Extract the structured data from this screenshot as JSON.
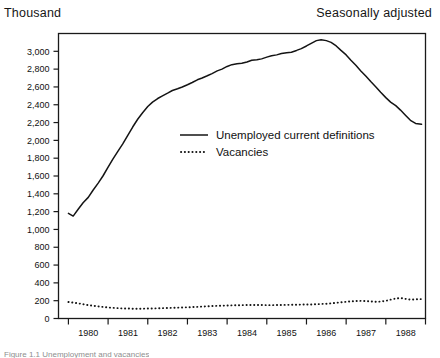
{
  "header": {
    "left": "Thousand",
    "right": "Seasonally adjusted"
  },
  "caption": "Figure 1.1  Unemployment and vacancies",
  "chart_data": {
    "type": "line",
    "title": "",
    "subtitle": "",
    "xlabel": "",
    "ylabel": "Thousand",
    "ylim": [
      0,
      3200
    ],
    "xlim": [
      1979.75,
      1989.0
    ],
    "grid": false,
    "legend_position": "inside-center",
    "yticks": [
      0,
      200,
      400,
      600,
      800,
      1000,
      1200,
      1400,
      1600,
      1800,
      2000,
      2200,
      2400,
      2600,
      2800,
      3000
    ],
    "ytick_labels": [
      "0",
      "200",
      "400",
      "600",
      "800",
      "1,000",
      "1,200",
      "1,400",
      "1,600",
      "1,800",
      "2,000",
      "2,200",
      "2,400",
      "2,600",
      "2,800",
      "3,000"
    ],
    "xticks": [
      1980,
      1981,
      1982,
      1983,
      1984,
      1985,
      1986,
      1987,
      1988,
      1989
    ],
    "xtick_labels": [
      "1980",
      "1981",
      "1982",
      "1983",
      "1984",
      "1985",
      "1986",
      "1987",
      "1988"
    ],
    "annotations": [
      "Thousand",
      "Seasonally adjusted"
    ],
    "series": [
      {
        "name": "Unemployed current definitions",
        "style": "solid",
        "color": "#141414",
        "x": [
          1980.0,
          1980.12,
          1980.25,
          1980.37,
          1980.5,
          1980.62,
          1980.75,
          1980.87,
          1981.0,
          1981.12,
          1981.25,
          1981.37,
          1981.5,
          1981.62,
          1981.75,
          1981.87,
          1982.0,
          1982.12,
          1982.25,
          1982.37,
          1982.5,
          1982.62,
          1982.75,
          1982.87,
          1983.0,
          1983.12,
          1983.25,
          1983.37,
          1983.5,
          1983.62,
          1983.75,
          1983.87,
          1984.0,
          1984.12,
          1984.25,
          1984.37,
          1984.5,
          1984.62,
          1984.75,
          1984.87,
          1985.0,
          1985.12,
          1985.25,
          1985.37,
          1985.5,
          1985.62,
          1985.75,
          1985.87,
          1986.0,
          1986.12,
          1986.25,
          1986.37,
          1986.5,
          1986.62,
          1986.75,
          1986.87,
          1987.0,
          1987.12,
          1987.25,
          1987.37,
          1987.5,
          1987.62,
          1987.75,
          1987.87,
          1988.0,
          1988.12,
          1988.25,
          1988.37,
          1988.5,
          1988.62,
          1988.75,
          1988.9
        ],
        "values": [
          1180,
          1150,
          1230,
          1300,
          1360,
          1440,
          1520,
          1600,
          1700,
          1790,
          1880,
          1960,
          2060,
          2150,
          2240,
          2310,
          2380,
          2430,
          2470,
          2500,
          2530,
          2560,
          2580,
          2600,
          2625,
          2650,
          2680,
          2700,
          2725,
          2750,
          2780,
          2800,
          2830,
          2850,
          2860,
          2865,
          2880,
          2900,
          2905,
          2915,
          2935,
          2950,
          2960,
          2975,
          2985,
          2990,
          3010,
          3030,
          3060,
          3090,
          3120,
          3130,
          3120,
          3100,
          3060,
          3010,
          2960,
          2900,
          2840,
          2780,
          2720,
          2660,
          2600,
          2540,
          2480,
          2430,
          2390,
          2340,
          2280,
          2225,
          2190,
          2180
        ],
        "endpoints": {
          "start": 1180,
          "peak": 3130,
          "peak_x": 1986.37,
          "end": 2180
        }
      },
      {
        "name": "Vacancies",
        "style": "dotted",
        "color": "#141414",
        "x": [
          1980.0,
          1980.12,
          1980.25,
          1980.37,
          1980.5,
          1980.62,
          1980.75,
          1980.87,
          1981.0,
          1981.12,
          1981.25,
          1981.37,
          1981.5,
          1981.62,
          1981.75,
          1981.87,
          1982.0,
          1982.12,
          1982.25,
          1982.37,
          1982.5,
          1982.62,
          1982.75,
          1982.87,
          1983.0,
          1983.12,
          1983.25,
          1983.37,
          1983.5,
          1983.62,
          1983.75,
          1983.87,
          1984.0,
          1984.12,
          1984.25,
          1984.37,
          1984.5,
          1984.62,
          1984.75,
          1984.87,
          1985.0,
          1985.12,
          1985.25,
          1985.37,
          1985.5,
          1985.62,
          1985.75,
          1985.87,
          1986.0,
          1986.12,
          1986.25,
          1986.37,
          1986.5,
          1986.62,
          1986.75,
          1986.87,
          1987.0,
          1987.12,
          1987.25,
          1987.37,
          1987.5,
          1987.62,
          1987.75,
          1987.87,
          1988.0,
          1988.12,
          1988.25,
          1988.37,
          1988.5,
          1988.62,
          1988.75,
          1988.9
        ],
        "values": [
          185,
          178,
          170,
          160,
          150,
          143,
          136,
          130,
          124,
          120,
          116,
          113,
          112,
          110,
          110,
          110,
          112,
          113,
          114,
          116,
          118,
          120,
          122,
          124,
          126,
          128,
          131,
          134,
          137,
          140,
          142,
          144,
          146,
          148,
          149,
          150,
          151,
          152,
          152,
          151,
          150,
          150,
          151,
          152,
          153,
          154,
          155,
          156,
          157,
          158,
          160,
          163,
          166,
          170,
          176,
          182,
          188,
          192,
          196,
          198,
          196,
          192,
          188,
          190,
          198,
          212,
          224,
          230,
          220,
          212,
          215,
          218
        ],
        "endpoints": {
          "start": 185,
          "min": 110,
          "max": 230,
          "end": 218
        }
      }
    ]
  }
}
